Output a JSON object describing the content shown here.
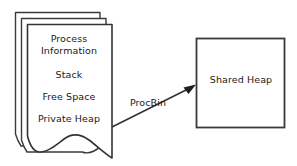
{
  "diagram": {
    "background_color": "#ffffff",
    "stroke_color": "#3a3a3a",
    "text_color": "#1a1a1a",
    "process_stack": {
      "name": "process-card-stack",
      "card_count": 3,
      "sections": [
        {
          "id": "process-information",
          "label": "Process\nInformation"
        },
        {
          "id": "stack",
          "label": "Stack"
        },
        {
          "id": "free-space",
          "label": "Free Space"
        },
        {
          "id": "private-heap",
          "label": "Private Heap"
        }
      ]
    },
    "shared_heap": {
      "name": "shared-heap-box",
      "label": "Shared Heap"
    },
    "connector": {
      "name": "procbin-arrow",
      "label": "ProcBin",
      "from": "private-heap",
      "to": "shared-heap",
      "direction": "right-up"
    }
  }
}
